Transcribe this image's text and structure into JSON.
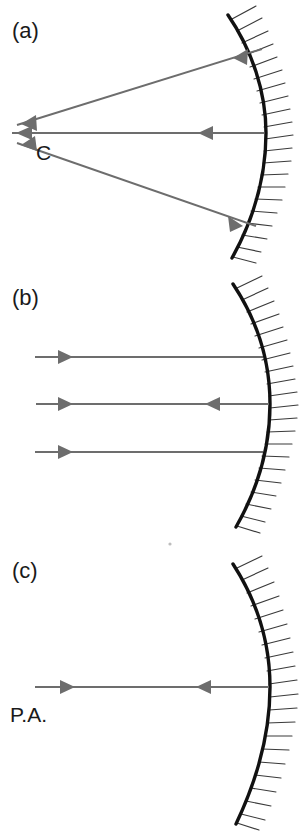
{
  "figure": {
    "background_color": "#ffffff",
    "ray_color": "#6d6d6d",
    "mirror_color": "#111111",
    "hatch_color": "#3a3a3a",
    "text_color": "#1a1a1a",
    "width": 303,
    "height": 833
  },
  "panels": [
    {
      "id": "a",
      "label": "(a)",
      "label_x": 12,
      "label_y": 38,
      "mirror": {
        "name": "concave-mirror-a",
        "top": {
          "x": 228,
          "y": 15
        },
        "vertex": {
          "x": 266,
          "y": 133
        },
        "bottom": {
          "x": 232,
          "y": 258
        },
        "hatch_count": 22,
        "hatch_length": 26
      },
      "focus_point": {
        "name": "center-of-curvature",
        "label": "C",
        "x": 47,
        "y": 133,
        "label_x": 36,
        "label_y": 160
      },
      "rays": [
        {
          "name": "ray-upper",
          "from": {
            "x": 262,
            "y": 49
          },
          "to": {
            "x": 17,
            "y": 125
          },
          "heads": [
            {
              "t": 0.12,
              "dir": "toward-origin"
            },
            {
              "t": 0.97,
              "dir": "toward-origin"
            }
          ]
        },
        {
          "name": "ray-axis",
          "from": {
            "x": 264,
            "y": 133
          },
          "to": {
            "x": 12,
            "y": 133
          },
          "heads": [
            {
              "t": 0.26,
              "dir": "toward-origin"
            },
            {
              "t": 0.98,
              "dir": "toward-origin"
            }
          ]
        },
        {
          "name": "ray-lower",
          "from": {
            "x": 256,
            "y": 226
          },
          "to": {
            "x": 17,
            "y": 143
          },
          "heads": [
            {
              "t": 0.12,
              "dir": "toward-origin"
            },
            {
              "t": 0.97,
              "dir": "toward-origin"
            }
          ]
        }
      ]
    },
    {
      "id": "b",
      "label": "(b)",
      "label_x": 12,
      "label_y": 305,
      "mirror": {
        "name": "concave-mirror-b",
        "top": {
          "x": 233,
          "y": 284
        },
        "vertex": {
          "x": 270,
          "y": 404
        },
        "bottom": {
          "x": 236,
          "y": 527
        },
        "hatch_count": 22,
        "hatch_length": 26
      },
      "rays": [
        {
          "name": "ray-top-incoming",
          "from": {
            "x": 35,
            "y": 357
          },
          "to": {
            "x": 263,
            "y": 357
          },
          "heads": [
            {
              "t": 0.26,
              "dir": "right"
            }
          ]
        },
        {
          "name": "ray-middle",
          "from": {
            "x": 36,
            "y": 404
          },
          "to": {
            "x": 269,
            "y": 404
          },
          "heads": [
            {
              "t": 0.26,
              "dir": "right"
            },
            {
              "t": 0.62,
              "dir": "left"
            }
          ]
        },
        {
          "name": "ray-bottom-incoming",
          "from": {
            "x": 35,
            "y": 452
          },
          "to": {
            "x": 263,
            "y": 452
          },
          "heads": [
            {
              "t": 0.26,
              "dir": "right"
            }
          ]
        }
      ]
    },
    {
      "id": "c",
      "label": "(c)",
      "label_x": 12,
      "label_y": 578,
      "mirror": {
        "name": "concave-mirror-c",
        "top": {
          "x": 233,
          "y": 564
        },
        "vertex": {
          "x": 270,
          "y": 687
        },
        "bottom": {
          "x": 236,
          "y": 824
        },
        "hatch_count": 23,
        "hatch_length": 26
      },
      "axis": {
        "name": "principal-axis",
        "label": "P.A.",
        "label_x": 10,
        "label_y": 722
      },
      "rays": [
        {
          "name": "ray-principal-axis",
          "from": {
            "x": 35,
            "y": 687
          },
          "to": {
            "x": 269,
            "y": 687
          },
          "heads": [
            {
              "t": 0.26,
              "dir": "right"
            },
            {
              "t": 0.62,
              "dir": "left"
            }
          ]
        }
      ]
    }
  ],
  "artifacts": [
    {
      "name": "scan-speck",
      "x": 170,
      "y": 544,
      "r": 1.6
    }
  ]
}
